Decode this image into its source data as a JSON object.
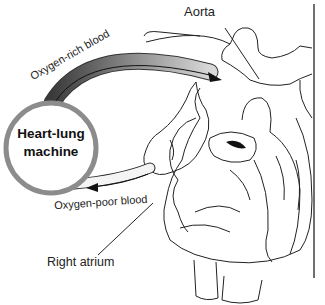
{
  "labels": {
    "aorta": "Aorta",
    "oxygen_rich": "Oxygen-rich blood",
    "oxygen_poor": "Oxygen-poor blood",
    "right_atrium": "Right atrium",
    "machine_line1": "Heart-lung",
    "machine_line2": "machine"
  },
  "colors": {
    "machine_ring": "#8c8c8c",
    "tube_dark": "#3a3a3a",
    "tube_light": "#c8c8c8",
    "line": "#222222"
  }
}
